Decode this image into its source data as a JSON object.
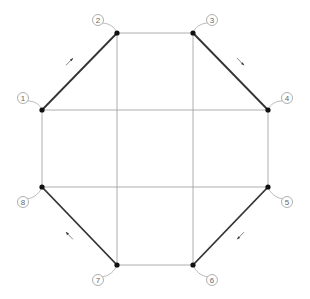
{
  "diagram": {
    "type": "octagon-node-layout",
    "colors": {
      "grid": "#9a9a9a",
      "bold_edge": "#333333",
      "node": "#111111",
      "label": "#666666"
    },
    "nodes": [
      {
        "id": "1",
        "label": "1",
        "x": 42,
        "y": 110,
        "lx": 23,
        "ly": 98
      },
      {
        "id": "2",
        "label": "2",
        "x": 117,
        "y": 33,
        "lx": 98,
        "ly": 20
      },
      {
        "id": "3",
        "label": "3",
        "x": 193,
        "y": 33,
        "lx": 212,
        "ly": 20
      },
      {
        "id": "4",
        "label": "4",
        "x": 268,
        "y": 110,
        "lx": 287,
        "ly": 98
      },
      {
        "id": "5",
        "label": "5",
        "x": 268,
        "y": 187,
        "lx": 287,
        "ly": 202
      },
      {
        "id": "6",
        "label": "6",
        "x": 193,
        "y": 265,
        "lx": 212,
        "ly": 280
      },
      {
        "id": "7",
        "label": "7",
        "x": 117,
        "y": 265,
        "lx": 98,
        "ly": 280
      },
      {
        "id": "8",
        "label": "8",
        "x": 42,
        "y": 187,
        "lx": 23,
        "ly": 202
      }
    ],
    "bold_edges": [
      {
        "from": "1",
        "to": "2",
        "arrow_direction": "toward-2"
      },
      {
        "from": "3",
        "to": "4",
        "arrow_direction": "toward-4"
      },
      {
        "from": "5",
        "to": "6",
        "arrow_direction": "toward-6"
      },
      {
        "from": "7",
        "to": "8",
        "arrow_direction": "toward-8"
      }
    ],
    "thin_edges": [
      {
        "from": "2",
        "to": "3"
      },
      {
        "from": "4",
        "to": "5"
      },
      {
        "from": "6",
        "to": "7"
      },
      {
        "from": "8",
        "to": "1"
      }
    ]
  }
}
